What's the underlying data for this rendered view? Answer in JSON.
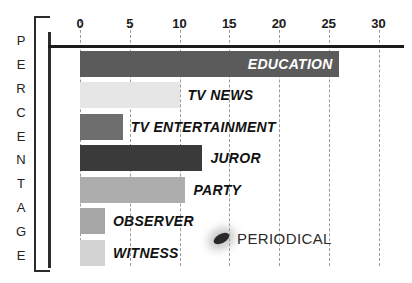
{
  "chart_data": {
    "type": "bar",
    "title": "",
    "subtitle": "",
    "xlabel": "",
    "ylabel": "PERCENTAGE",
    "orientation": "horizontal",
    "grid": true,
    "legend": "none",
    "xlim": [
      0,
      31
    ],
    "xticks": [
      0,
      5,
      10,
      15,
      20,
      25,
      30
    ],
    "xtick_labels": [
      "0",
      "5",
      "10",
      "15",
      "20",
      "25",
      "30"
    ],
    "categories": [
      "EDUCATION",
      "TV NEWS",
      "TV ENTERTAINMENT",
      "JUROR",
      "PARTY",
      "OBSERVER",
      "PERIODICAL",
      "WITNESS"
    ],
    "values": [
      26,
      10,
      4.3,
      12.3,
      10.6,
      2.5,
      0.2,
      2.5
    ],
    "bars": [
      {
        "label": "EDUCATION",
        "value": 26,
        "color": "#5b5b5b",
        "label_position": "inside"
      },
      {
        "label": "TV NEWS",
        "value": 10,
        "color": "#e6e6e6",
        "label_position": "outside"
      },
      {
        "label": "TV ENTERTAINMENT",
        "value": 4.3,
        "color": "#6e6e6e",
        "label_position": "outside"
      },
      {
        "label": "JUROR",
        "value": 12.3,
        "color": "#3a3a3a",
        "label_position": "outside"
      },
      {
        "label": "PARTY",
        "value": 10.6,
        "color": "#adadad",
        "label_position": "outside"
      },
      {
        "label": "OBSERVER",
        "value": 2.5,
        "color": "#a6a6a6",
        "label_position": "outside"
      },
      {
        "label": "WITNESS",
        "value": 2.5,
        "color": "#d2d2d2",
        "label_position": "outside"
      }
    ],
    "annotations": [
      {
        "label": "PERIODICAL",
        "value": 0.2,
        "marker": "ellipse",
        "color": "#2a2a2a"
      }
    ],
    "ylabel_letters": [
      "P",
      "E",
      "R",
      "C",
      "E",
      "N",
      "T",
      "A",
      "G",
      "E"
    ]
  },
  "colors": {
    "axis": "#1b1b1b",
    "grid": "#9a9a9a",
    "background": "#ffffff",
    "text": "#111111"
  }
}
